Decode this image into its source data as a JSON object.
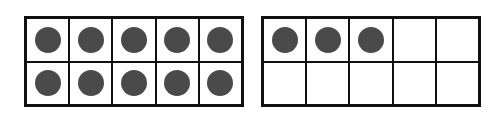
{
  "frames": [
    {
      "label": "ten-frame-1",
      "filled": 10,
      "total": 10
    },
    {
      "label": "ten-frame-2",
      "filled": 3,
      "total": 10
    }
  ],
  "colors": {
    "dot": "#4a4a4a",
    "border": "#111111"
  }
}
